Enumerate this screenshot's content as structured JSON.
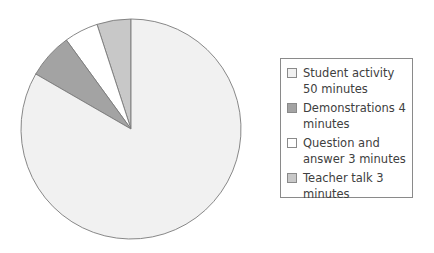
{
  "chart_data": {
    "type": "pie",
    "title": "",
    "unit": "minutes",
    "total": 60,
    "start_angle_deg": 0,
    "direction": "counterclockwise-from-top for small slices",
    "slices": [
      {
        "label": "Student activity 50 minutes",
        "name": "Student activity",
        "value": 50,
        "color": "#f1f1f1"
      },
      {
        "label": "Demonstrations 4 minutes",
        "name": "Demonstrations",
        "value": 4,
        "color": "#a3a3a3"
      },
      {
        "label": "Question and answer 3 minutes",
        "name": "Question and answer",
        "value": 3,
        "color": "#ffffff"
      },
      {
        "label": "Teacher talk 3 minutes",
        "name": "Teacher talk",
        "value": 3,
        "color": "#c8c8c8"
      }
    ],
    "legend_position": "right"
  },
  "legend": {
    "items": [
      {
        "label": "Student activity 50 minutes",
        "color": "#f1f1f1"
      },
      {
        "label": "Demonstrations 4 minutes",
        "color": "#a3a3a3"
      },
      {
        "label": "Question and answer 3 minutes",
        "color": "#ffffff"
      },
      {
        "label": "Teacher talk 3 minutes",
        "color": "#c8c8c8"
      }
    ]
  }
}
